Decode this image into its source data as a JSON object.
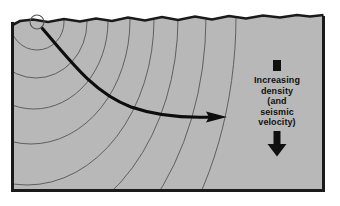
{
  "figure": {
    "type": "geologic cross-section diagram",
    "colors": {
      "page_background": "#ffffff",
      "ground_fill": "#b8b8b8",
      "border": "#1a1a1a",
      "wavefront_line": "#55555a",
      "ray_arrow": "#0d0d0d",
      "text": "#101010"
    }
  },
  "diagram": {
    "frame": {
      "name": "cross-section frame",
      "x": 11,
      "y": 11,
      "width": 314,
      "height": 181,
      "border_width": 3
    },
    "ground_surface": {
      "name": "irregular ground surface",
      "description": "wavy top edge of the cross-section"
    },
    "source": {
      "name": "seismic source",
      "cx": 37,
      "cy": 22,
      "r": 7,
      "description": "open circle marking the earthquake focus / shot point"
    },
    "wavefronts": {
      "name": "expanding wavefronts",
      "count": 8,
      "description": "concentric arcs radiating from the source, progressively flattened with depth"
    },
    "ray": {
      "name": "curved seismic ray path",
      "start_x": 42,
      "start_y": 28,
      "end_x": 227,
      "end_y": 117,
      "description": "ray bends (refracts) upward as velocity increases with depth"
    }
  },
  "legend": {
    "marker_name": "density-gradient-marker",
    "lines": [
      "Increasing",
      "density",
      "(and",
      "seismic",
      "velocity)"
    ],
    "arrow_name": "down-arrow",
    "arrow_direction": "down"
  }
}
